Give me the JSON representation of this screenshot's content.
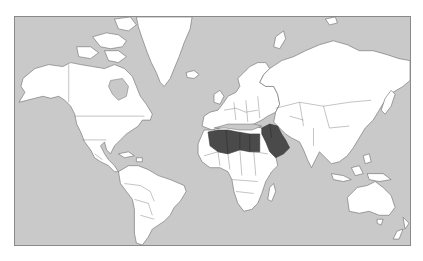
{
  "map": {
    "projection": "Mercator world map",
    "colors": {
      "page_background": "#ffffff",
      "ocean": "#c9c9c9",
      "land": "#ffffff",
      "highlight": "#4a4a4a",
      "outline": "#6a6a6a",
      "frame": "#8a8a8a"
    },
    "highlighted_region": {
      "label": "North Africa and Arabian Peninsula",
      "countries": [
        "Morocco",
        "Algeria",
        "Tunisia",
        "Libya",
        "Egypt",
        "Jordan",
        "Syria",
        "Iraq",
        "Saudi Arabia",
        "Yemen",
        "Oman",
        "United Arab Emirates",
        "Kuwait",
        "Lebanon"
      ]
    },
    "continents": [
      {
        "name": "North America"
      },
      {
        "name": "Greenland"
      },
      {
        "name": "South America"
      },
      {
        "name": "Europe"
      },
      {
        "name": "Africa"
      },
      {
        "name": "Asia"
      },
      {
        "name": "Australia"
      },
      {
        "name": "New Zealand"
      }
    ]
  }
}
